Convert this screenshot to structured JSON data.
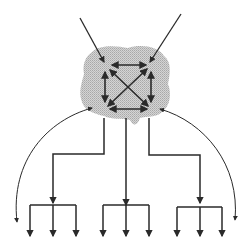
{
  "diagram": {
    "type": "network-hierarchy",
    "colors": {
      "background": "#ffffff",
      "line": "#2a2a2a",
      "cloud": "#c8c8c8"
    },
    "cloud": {
      "label": "",
      "path": "M92,52 C100,44 118,46 128,48 C140,44 158,46 164,56 C172,62 170,74 168,84 C172,94 170,106 162,112 C156,118 146,116 140,118 C138,124 134,128 130,120 C122,118 112,120 104,116 C94,114 84,110 82,102 C78,92 82,82 84,74 C82,64 86,56 92,52 Z"
    },
    "inbound_arrows": [
      {
        "name": "inbound-arrow-left",
        "x1": 80,
        "y1": 18,
        "x2": 104,
        "y2": 62
      },
      {
        "name": "inbound-arrow-right",
        "x1": 181,
        "y1": 14,
        "x2": 150,
        "y2": 62
      }
    ],
    "mesh_nodes": [
      {
        "name": "tl",
        "x": 106,
        "y": 67
      },
      {
        "name": "tr",
        "x": 150,
        "y": 67
      },
      {
        "name": "bl",
        "x": 106,
        "y": 106
      },
      {
        "name": "br",
        "x": 150,
        "y": 106
      }
    ],
    "mesh_links": [
      {
        "name": "top",
        "x1": 112,
        "y1": 65,
        "x2": 146,
        "y2": 65
      },
      {
        "name": "bottom",
        "x1": 110,
        "y1": 109,
        "x2": 147,
        "y2": 109
      },
      {
        "name": "left",
        "x1": 105,
        "y1": 72,
        "x2": 105,
        "y2": 102
      },
      {
        "name": "right",
        "x1": 151,
        "y1": 72,
        "x2": 151,
        "y2": 102
      },
      {
        "name": "diag-tl-br",
        "x1": 110,
        "y1": 70,
        "x2": 148,
        "y2": 106
      },
      {
        "name": "diag-tr-bl",
        "x1": 147,
        "y1": 69,
        "x2": 108,
        "y2": 106
      }
    ],
    "arcs": [
      {
        "name": "arc-left",
        "d": "M92,108 C48,120 10,160 17,222"
      },
      {
        "name": "arc-right",
        "d": "M160,109 C205,122 240,165 235,220"
      }
    ],
    "branches": [
      {
        "name": "branch-left",
        "points": "104,118 104,154 53,154 53,203"
      },
      {
        "name": "branch-middle",
        "points": "126,118 126,205"
      },
      {
        "name": "branch-right",
        "points": "149,118 149,155 200,155 200,203"
      }
    ],
    "trees": [
      {
        "name": "tree-left",
        "bar_y": 205,
        "x_left": 30,
        "x_right": 76,
        "x_mid": 53,
        "leaf_bottom": 236,
        "leaves": [
          30,
          53,
          76
        ]
      },
      {
        "name": "tree-middle",
        "bar_y": 205,
        "x_left": 103,
        "x_right": 149,
        "x_mid": 126,
        "leaf_bottom": 236,
        "leaves": [
          103,
          126,
          149
        ]
      },
      {
        "name": "tree-right",
        "bar_y": 207,
        "x_left": 177,
        "x_right": 222,
        "x_mid": 200,
        "leaf_bottom": 236,
        "leaves": [
          177,
          200,
          222
        ]
      }
    ]
  }
}
